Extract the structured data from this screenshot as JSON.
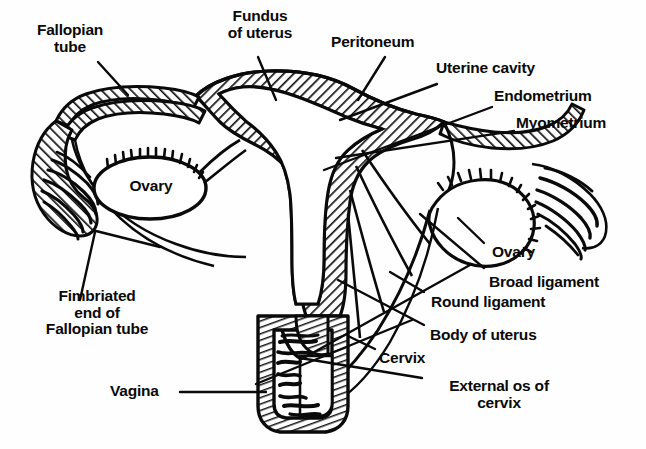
{
  "diagram": {
    "background_color": "#fefefe",
    "ink_color": "#0a0a0a",
    "hatch_color": "#1a1a1a"
  },
  "labels": {
    "fallopian_tube": "Fallopian\ntube",
    "fundus_of_uterus": "Fundus\nof uterus",
    "peritoneum": "Peritoneum",
    "uterine_cavity": "Uterine cavity",
    "endometrium": "Endometrium",
    "myometrium": "Myometrium",
    "ovary_left": "Ovary",
    "ovary_right": "Ovary",
    "broad_ligament": "Broad ligament",
    "round_ligament": "Round ligament",
    "body_of_uterus": "Body of uterus",
    "cervix": "Cervix",
    "external_os_of_cervix": "External os of\ncervix",
    "fimbriated_end": "Fimbriated\nend of\nFallopian tube",
    "vagina": "Vagina"
  },
  "structures": [
    {
      "name": "fallopian-tube-left",
      "fill": "hatched"
    },
    {
      "name": "fallopian-tube-right",
      "fill": "hatched"
    },
    {
      "name": "uterus-wall",
      "fill": "hatched"
    },
    {
      "name": "uterine-cavity",
      "fill": "white"
    },
    {
      "name": "ovary-left",
      "fill": "white"
    },
    {
      "name": "ovary-right",
      "fill": "white"
    },
    {
      "name": "fimbriae-left",
      "fill": "line"
    },
    {
      "name": "fimbriae-right",
      "fill": "line"
    },
    {
      "name": "vagina-wall",
      "fill": "hatched"
    },
    {
      "name": "vaginal-rugae",
      "fill": "line"
    },
    {
      "name": "broad-ligament",
      "fill": "white"
    }
  ]
}
